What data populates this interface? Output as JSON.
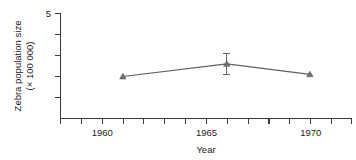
{
  "chart_data": {
    "type": "line",
    "title": "",
    "xlabel": "Year",
    "ylabel": "Zebra population size (× 100 000)",
    "ylabel_line1": "Zebra population size",
    "ylabel_line2": "(× 100 000)",
    "x": [
      1961,
      1966,
      1970
    ],
    "values": [
      2.0,
      2.6,
      2.1
    ],
    "errors": [
      null,
      0.5,
      null
    ],
    "series": [
      {
        "name": "Zebra population size",
        "points": [
          {
            "x": 1961,
            "y": 2.0,
            "err": null
          },
          {
            "x": 1966,
            "y": 2.6,
            "err": 0.5
          },
          {
            "x": 1970,
            "y": 2.1,
            "err": null
          }
        ]
      }
    ],
    "xlim": [
      1958,
      1972
    ],
    "ylim": [
      0,
      5
    ],
    "xticks": [
      1958,
      1959,
      1960,
      1961,
      1962,
      1963,
      1964,
      1965,
      1966,
      1967,
      1968,
      1969,
      1970,
      1971,
      1972
    ],
    "xtick_labels": [
      "",
      "",
      "1960",
      "",
      "",
      "",
      "",
      "1965",
      "",
      "",
      "",
      "",
      "1970",
      "",
      ""
    ],
    "yticks": [
      1,
      2,
      3,
      4,
      5
    ],
    "ytick_labels": [
      "",
      "",
      "",
      "",
      "5"
    ],
    "grid": false,
    "legend": "none",
    "marker": "triangle",
    "colors": {
      "axis": "#3a3a3a",
      "line": "#606060",
      "marker": "#707070",
      "text": "#1a1a1a",
      "background": "#ffffff"
    }
  },
  "axis_labels": {
    "x_title": "Year",
    "y_title_line1": "Zebra population size",
    "y_title_line2": "(× 100 000)",
    "y_max_label": "5",
    "x_label_1960": "1960",
    "x_label_1965": "1965",
    "x_label_1970": "1970"
  }
}
